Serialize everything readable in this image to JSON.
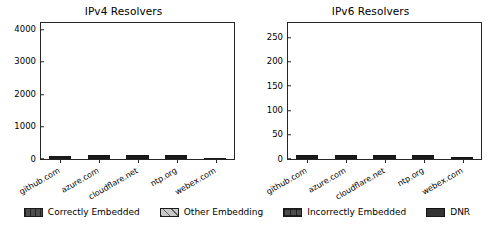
{
  "chart_data": [
    {
      "type": "bar",
      "title": "IPv4 Resolvers",
      "xlabel": "",
      "ylabel": "",
      "ylim": [
        0,
        4200
      ],
      "yticks": [
        0,
        1000,
        2000,
        3000,
        4000
      ],
      "grid": false,
      "stacked": true,
      "categories": [
        "github.com",
        "azure.com",
        "cloudflare.net",
        "ntp.org",
        "webex.com"
      ],
      "series": [
        {
          "name": "Correctly Embedded",
          "values": [
            1700,
            400,
            1100,
            1030,
            3250
          ]
        },
        {
          "name": "Other Embedding",
          "values": [
            900,
            1250,
            1250,
            1220,
            0
          ]
        },
        {
          "name": "Incorrectly Embedded",
          "values": [
            1350,
            690,
            40,
            70,
            0
          ]
        },
        {
          "name": "DNR",
          "values": [
            0,
            20,
            10,
            10,
            0
          ]
        }
      ],
      "totals": [
        3950,
        2360,
        2400,
        2330,
        3250
      ]
    },
    {
      "type": "bar",
      "title": "IPv6 Resolvers",
      "xlabel": "",
      "ylabel": "",
      "ylim": [
        0,
        280
      ],
      "yticks": [
        0,
        50,
        100,
        150,
        200,
        250
      ],
      "grid": false,
      "stacked": true,
      "categories": [
        "github.com",
        "azure.com",
        "cloudflare.net",
        "ntp.org",
        "webex.com"
      ],
      "series": [
        {
          "name": "Correctly Embedded",
          "values": [
            95,
            33,
            50,
            60,
            175
          ]
        },
        {
          "name": "Other Embedding",
          "values": [
            120,
            80,
            62,
            55,
            0
          ]
        },
        {
          "name": "Incorrectly Embedded",
          "values": [
            50,
            35,
            27,
            28,
            0
          ]
        },
        {
          "name": "DNR",
          "values": [
            3,
            3,
            3,
            3,
            8
          ]
        }
      ],
      "totals": [
        268,
        151,
        142,
        146,
        183
      ]
    }
  ],
  "legend": {
    "position": "bottom",
    "items": [
      {
        "label": "Correctly Embedded",
        "pattern": "vertical-hatch-dark",
        "color": "#4d4d4d"
      },
      {
        "label": "Other Embedding",
        "pattern": "diagonal-hatch-light",
        "color": "#c8c8c8"
      },
      {
        "label": "Incorrectly Embedded",
        "pattern": "cross-hatch-dark",
        "color": "#4d4d4d"
      },
      {
        "label": "DNR",
        "pattern": "solid-dark",
        "color": "#333333"
      }
    ]
  }
}
